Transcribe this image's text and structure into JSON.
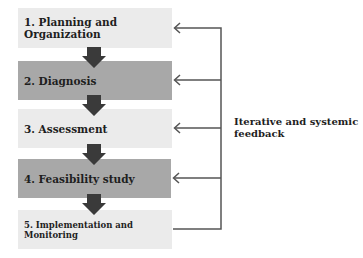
{
  "steps": [
    {
      "label": "1. Planning and Organization",
      "shade": "light"
    },
    {
      "label": "2. Diagnosis",
      "shade": "dark"
    },
    {
      "label": "3. Assessment",
      "shade": "light"
    },
    {
      "label": "4. Feasibility study",
      "shade": "dark"
    },
    {
      "label": "5. Implementation and Monitoring",
      "shade": "light"
    }
  ],
  "feedback": {
    "label": "Iterative and systemic feedback"
  },
  "colors": {
    "light_box": "#ebebeb",
    "dark_box": "#a8a8a8",
    "arrow": "#3a3a3a",
    "feedback_line": "#555555"
  }
}
